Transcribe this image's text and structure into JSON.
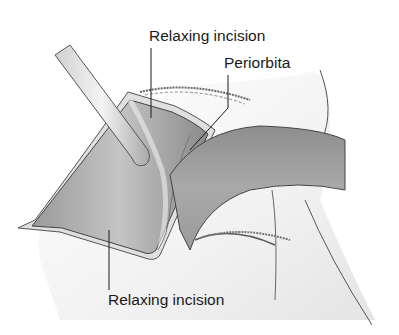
{
  "figure": {
    "labels": {
      "relaxing_incision_top": "Relaxing incision",
      "periorbita": "Periorbita",
      "relaxing_incision_bottom": "Relaxing incision"
    },
    "colors": {
      "background": "#ffffff",
      "line": "#1a1a1a",
      "tissue_dark": "#8c8c8c",
      "tissue_mid": "#b5b5b5",
      "skin_light": "#e6e6e6"
    }
  }
}
